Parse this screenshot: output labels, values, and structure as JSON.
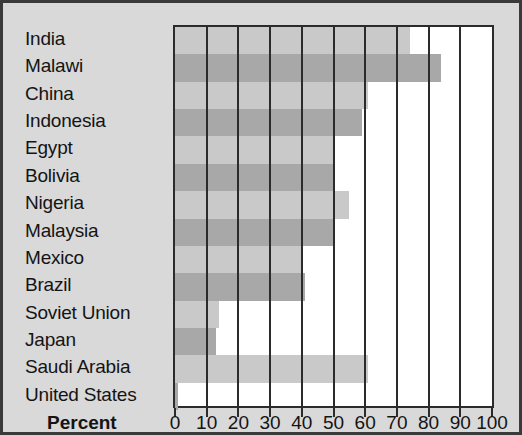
{
  "chart_data": {
    "type": "bar",
    "orientation": "horizontal",
    "title": "",
    "xlabel": "Percent",
    "ylabel": "",
    "xlim": [
      0,
      100
    ],
    "xticks": [
      0,
      10,
      20,
      30,
      40,
      50,
      60,
      70,
      80,
      90,
      100
    ],
    "xtick_labels": [
      "0",
      "10",
      "20",
      "30",
      "40",
      "50",
      "60",
      "70",
      "80",
      "90",
      "100"
    ],
    "grid": true,
    "legend": false,
    "categories": [
      "India",
      "Malawi",
      "China",
      "Indonesia",
      "Egypt",
      "Bolivia",
      "Nigeria",
      "Malaysia",
      "Mexico",
      "Brazil",
      "Soviet Union",
      "Japan",
      "Saudi Arabia",
      "United States"
    ],
    "values": [
      74,
      84,
      61,
      59,
      50,
      50,
      55,
      50,
      40,
      41,
      14,
      13,
      61,
      1
    ],
    "bar_colors": [
      "#c9c9c9",
      "#a8a8a8"
    ],
    "colors": {
      "background": "#d9d9d9",
      "plot_background": "#ffffff",
      "axis": "#2b2b2b",
      "text": "#141414",
      "bar_light": "#c9c9c9",
      "bar_dark": "#a8a8a8"
    }
  }
}
